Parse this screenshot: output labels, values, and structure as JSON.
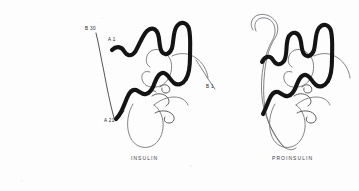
{
  "figure": {
    "background_color": "#fdfdfd",
    "thick_chain_color": "#141414",
    "thin_chain_color": "#6e6e72"
  },
  "panels": [
    {
      "id": "insulin",
      "caption": "INSULIN",
      "labels": [
        {
          "id": "b30",
          "text": "B 30"
        },
        {
          "id": "a1",
          "text": "A 1"
        },
        {
          "id": "a21",
          "text": "A 21"
        }
      ]
    },
    {
      "id": "proinsulin",
      "caption": "PROINSULIN",
      "labels": [
        {
          "id": "b1",
          "text": "B 1"
        }
      ]
    }
  ],
  "labels": {
    "b30": "B 30",
    "a1": "A 1",
    "a21": "A 21",
    "b1": "B 1"
  },
  "captions": {
    "insulin": "INSULIN",
    "proinsulin": "PROINSULIN"
  }
}
